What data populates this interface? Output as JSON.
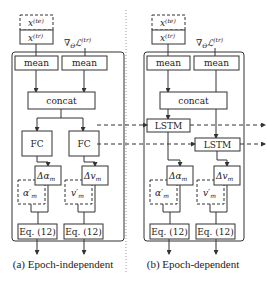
{
  "panels": [
    {
      "caption": "(a) Epoch-independent",
      "input_test": "x",
      "input_test_sup": "(te)",
      "input_train": "x",
      "input_train_sup": "(tr)",
      "grad_label": "∇",
      "grad_sub": "Θ",
      "grad_L": "ℒ",
      "grad_L_sup": "(tr)",
      "grad_L_sub": "m",
      "mean_left": "mean",
      "mean_right": "mean",
      "concat": "concat",
      "branch_left": "FC",
      "branch_right": "FC",
      "delta_alpha": "Δα",
      "delta_alpha_sub": "m",
      "delta_v": "Δv",
      "delta_v_sub": "m",
      "alpha_prime": "α′",
      "alpha_prime_sub": "m",
      "v_prime": "v′",
      "v_prime_sub": "m",
      "eq_left": "Eq. (12)",
      "eq_right": "Eq. (12)"
    },
    {
      "caption": "(b) Epoch-dependent",
      "input_test": "x",
      "input_test_sup": "(te)",
      "input_train": "x",
      "input_train_sup": "(tr)",
      "grad_label": "∇",
      "grad_sub": "Θ",
      "grad_L": "ℒ",
      "grad_L_sup": "(tr)",
      "grad_L_sub": "m",
      "mean_left": "mean",
      "mean_right": "mean",
      "concat": "concat",
      "branch_left": "LSTM",
      "branch_right": "LSTM",
      "delta_alpha": "Δα",
      "delta_alpha_sub": "m",
      "delta_v": "Δv",
      "delta_v_sub": "m",
      "alpha_prime": "α′",
      "alpha_prime_sub": "m",
      "v_prime": "v′",
      "v_prime_sub": "m",
      "eq_left": "Eq. (12)",
      "eq_right": "Eq. (12)"
    }
  ]
}
